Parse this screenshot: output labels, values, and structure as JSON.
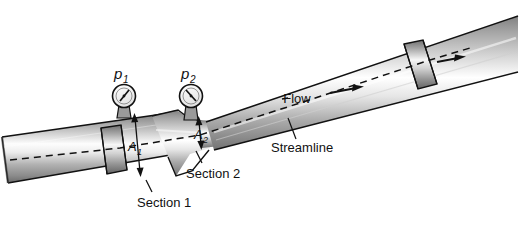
{
  "figure": {
    "kind": "engineering-diagram",
    "background_color": "#ffffff",
    "ink_color": "#111111"
  },
  "gauges": [
    {
      "id": "gauge-p1",
      "label": "p",
      "subscript": "1",
      "needle_direction": "up-right",
      "cx": 124,
      "cy": 96,
      "r": 11
    },
    {
      "id": "gauge-p2",
      "label": "p",
      "subscript": "2",
      "needle_direction": "up-left",
      "cx": 191,
      "cy": 96,
      "r": 11
    }
  ],
  "dimensions": [
    {
      "id": "area-1",
      "label": "A",
      "subscript": "1",
      "description": "inlet cross-sectional area"
    },
    {
      "id": "area-2",
      "label": "A",
      "subscript": "2",
      "description": "throat cross-sectional area"
    }
  ],
  "callouts": [
    {
      "id": "section-1",
      "text": "Section 1",
      "x": 137,
      "y": 207,
      "leader_from_x": 152,
      "leader_from_y": 192,
      "leader_to_x": 146,
      "leader_to_y": 180
    },
    {
      "id": "section-2",
      "text": "Section 2",
      "x": 186,
      "y": 178,
      "leader_from_x": 202,
      "leader_from_y": 163,
      "leader_to_x": 196,
      "leader_to_y": 151
    },
    {
      "id": "streamline",
      "text": "Streamline",
      "x": 271,
      "y": 152,
      "leader_from_x": 296,
      "leader_from_y": 139,
      "leader_to_x": 288,
      "leader_to_y": 120
    }
  ],
  "flow": {
    "label": "Flow",
    "label_x": 303,
    "label_y": 102,
    "arrows": [
      {
        "id": "flow-arrow-main",
        "x1": 330,
        "y1": 94,
        "x2": 358,
        "y2": 88
      },
      {
        "id": "flow-arrow-outlet",
        "x1": 436,
        "y1": 62,
        "x2": 462,
        "y2": 57
      }
    ],
    "streamline_style": "dashed"
  },
  "pipe": {
    "flanges": [
      {
        "id": "flange-inlet",
        "position": "left"
      },
      {
        "id": "flange-outlet",
        "position": "right"
      }
    ],
    "sections": [
      "inlet barrel",
      "converging cone",
      "throat",
      "diverging cone",
      "outlet barrel"
    ]
  },
  "colors": {
    "metal_dark": "#6e6e6e",
    "metal_mid": "#b5b5b5",
    "metal_light": "#f2f2f2",
    "outline": "#111111"
  }
}
